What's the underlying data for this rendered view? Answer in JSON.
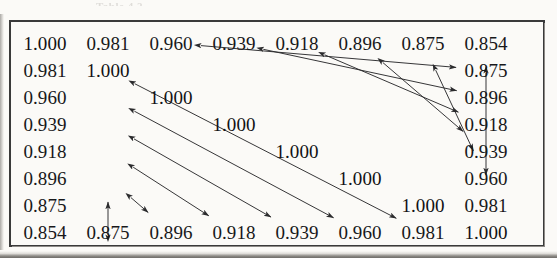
{
  "figure": {
    "caption_remnant": "Table 4.2",
    "box_border_color": "#3a3a3a",
    "paper_color": "#fbfaf7",
    "ink_color": "#18181a"
  },
  "chart_data": {
    "type": "table",
    "title": "",
    "xlabel": "",
    "ylabel": "",
    "grid": false,
    "legend": null,
    "n_rows": 8,
    "n_cols": 8,
    "categories": [
      "1",
      "2",
      "3",
      "4",
      "5",
      "6",
      "7",
      "8"
    ],
    "row_headers": [],
    "column_headers": [],
    "rows": [
      [
        "1.000",
        "0.981",
        "0.960",
        "0.939",
        "0.918",
        "0.896",
        "0.875",
        "0.854"
      ],
      [
        "0.981",
        "1.000",
        "0.981",
        "0.960",
        "0.939",
        "0.918",
        "0.896",
        "0.875"
      ],
      [
        "0.960",
        "0.981",
        "1.000",
        "0.981",
        "0.960",
        "0.939",
        "0.918",
        "0.896"
      ],
      [
        "0.939",
        "0.960",
        "0.981",
        "1.000",
        "0.981",
        "0.960",
        "0.939",
        "0.918"
      ],
      [
        "0.918",
        "0.939",
        "0.960",
        "0.981",
        "1.000",
        "0.981",
        "0.960",
        "0.939"
      ],
      [
        "0.896",
        "0.918",
        "0.939",
        "0.960",
        "0.981",
        "1.000",
        "0.981",
        "0.960"
      ],
      [
        "0.875",
        "0.896",
        "0.918",
        "0.939",
        "0.960",
        "0.981",
        "1.000",
        "0.981"
      ],
      [
        "0.854",
        "0.875",
        "0.896",
        "0.918",
        "0.939",
        "0.960",
        "0.981",
        "1.000"
      ]
    ],
    "visible_cells": [
      {
        "row": 0,
        "col": 0,
        "value": "1.000"
      },
      {
        "row": 0,
        "col": 1,
        "value": "0.981"
      },
      {
        "row": 0,
        "col": 2,
        "value": "0.960"
      },
      {
        "row": 0,
        "col": 3,
        "value": "0.939"
      },
      {
        "row": 0,
        "col": 4,
        "value": "0.918"
      },
      {
        "row": 0,
        "col": 5,
        "value": "0.896"
      },
      {
        "row": 0,
        "col": 6,
        "value": "0.875"
      },
      {
        "row": 0,
        "col": 7,
        "value": "0.854"
      },
      {
        "row": 1,
        "col": 0,
        "value": "0.981"
      },
      {
        "row": 1,
        "col": 1,
        "value": "1.000"
      },
      {
        "row": 1,
        "col": 7,
        "value": "0.875"
      },
      {
        "row": 2,
        "col": 0,
        "value": "0.960"
      },
      {
        "row": 2,
        "col": 2,
        "value": "1.000"
      },
      {
        "row": 2,
        "col": 7,
        "value": "0.896"
      },
      {
        "row": 3,
        "col": 0,
        "value": "0.939"
      },
      {
        "row": 3,
        "col": 3,
        "value": "1.000"
      },
      {
        "row": 3,
        "col": 7,
        "value": "0.918"
      },
      {
        "row": 4,
        "col": 0,
        "value": "0.918"
      },
      {
        "row": 4,
        "col": 4,
        "value": "1.000"
      },
      {
        "row": 4,
        "col": 7,
        "value": "0.939"
      },
      {
        "row": 5,
        "col": 0,
        "value": "0.896"
      },
      {
        "row": 5,
        "col": 5,
        "value": "1.000"
      },
      {
        "row": 5,
        "col": 7,
        "value": "0.960"
      },
      {
        "row": 6,
        "col": 0,
        "value": "0.875"
      },
      {
        "row": 6,
        "col": 6,
        "value": "1.000"
      },
      {
        "row": 6,
        "col": 7,
        "value": "0.981"
      },
      {
        "row": 7,
        "col": 0,
        "value": "0.854"
      },
      {
        "row": 7,
        "col": 1,
        "value": "0.875"
      },
      {
        "row": 7,
        "col": 2,
        "value": "0.896"
      },
      {
        "row": 7,
        "col": 3,
        "value": "0.918"
      },
      {
        "row": 7,
        "col": 4,
        "value": "0.939"
      },
      {
        "row": 7,
        "col": 5,
        "value": "0.960"
      },
      {
        "row": 7,
        "col": 6,
        "value": "0.981"
      },
      {
        "row": 7,
        "col": 7,
        "value": "1.000"
      }
    ],
    "annotations": {
      "style": "double-headed-arrow",
      "meaning": "links equal-valued symmetric entries",
      "pairs": [
        {
          "from_row": 6,
          "from_col": 1,
          "to_row": 7,
          "to_col": 1,
          "value": "0.875"
        },
        {
          "from_row": 5,
          "from_col": 1,
          "to_row": 7,
          "to_col": 2,
          "value": "0.896"
        },
        {
          "from_row": 4,
          "from_col": 1,
          "to_row": 7,
          "to_col": 3,
          "value": "0.918"
        },
        {
          "from_row": 3,
          "from_col": 1,
          "to_row": 7,
          "to_col": 4,
          "value": "0.939"
        },
        {
          "from_row": 2,
          "from_col": 1,
          "to_row": 7,
          "to_col": 5,
          "value": "0.960"
        },
        {
          "from_row": 1,
          "from_col": 1,
          "to_row": 7,
          "to_col": 6,
          "value": "0.981"
        },
        {
          "from_row": 0,
          "from_col": 2,
          "to_row": 1,
          "to_col": 7,
          "value": "0.960"
        },
        {
          "from_row": 0,
          "from_col": 3,
          "to_row": 2,
          "to_col": 7,
          "value": "0.939"
        },
        {
          "from_row": 0,
          "from_col": 4,
          "to_row": 3,
          "to_col": 7,
          "value": "0.918"
        },
        {
          "from_row": 0,
          "from_col": 5,
          "to_row": 4,
          "to_col": 7,
          "value": "0.896"
        },
        {
          "from_row": 0,
          "from_col": 6,
          "to_row": 5,
          "to_col": 7,
          "value": "0.875"
        },
        {
          "from_row": 0,
          "from_col": 7,
          "to_row": 6,
          "to_col": 7,
          "value": "0.854"
        }
      ]
    }
  },
  "layout": {
    "col_x": [
      14,
      77,
      140,
      203,
      266,
      329,
      392,
      455
    ],
    "row_y": [
      34,
      61,
      88,
      115,
      142,
      169,
      196,
      223
    ]
  }
}
